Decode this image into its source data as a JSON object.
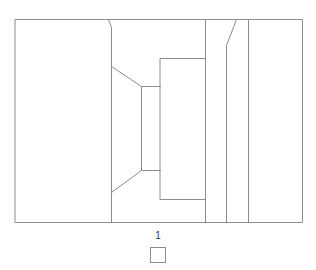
{
  "figure": {
    "background_color": "#ffffff",
    "stroke_color": "#8c8c8c",
    "stroke_width": 1,
    "canvas": {
      "width": 316,
      "height": 270
    },
    "outer_frame": {
      "x": 15,
      "y": 19,
      "width": 287,
      "height": 203
    }
  },
  "legend": {
    "label": "1",
    "swatch_fill": "#ffffff",
    "swatch_border": "#8c8c8c"
  },
  "geometry": {
    "outer_rect": "M 15 19 L 302 19 L 302 222 L 15 222 Z",
    "region_divider_left": "M 108 19 L 111 27 L 111 222",
    "upper_slant": "M 111 66 L 141 86",
    "lower_slant": "M 111 192 L 141 170",
    "inner_core_left": "M 141 86 L 141 170",
    "inner_core_top": "M 141 86 L 160 86",
    "inner_core_bottom": "M 141 170 L 160 170",
    "inner_box": "M 160 58 L 205 58 L 205 199 L 160 199 Z",
    "mid_vertical": "M 205 19 L 205 222",
    "bevel_right": "M 236 19 L 226 45 L 226 222",
    "right_vertical": "M 248 19 L 248 222"
  }
}
